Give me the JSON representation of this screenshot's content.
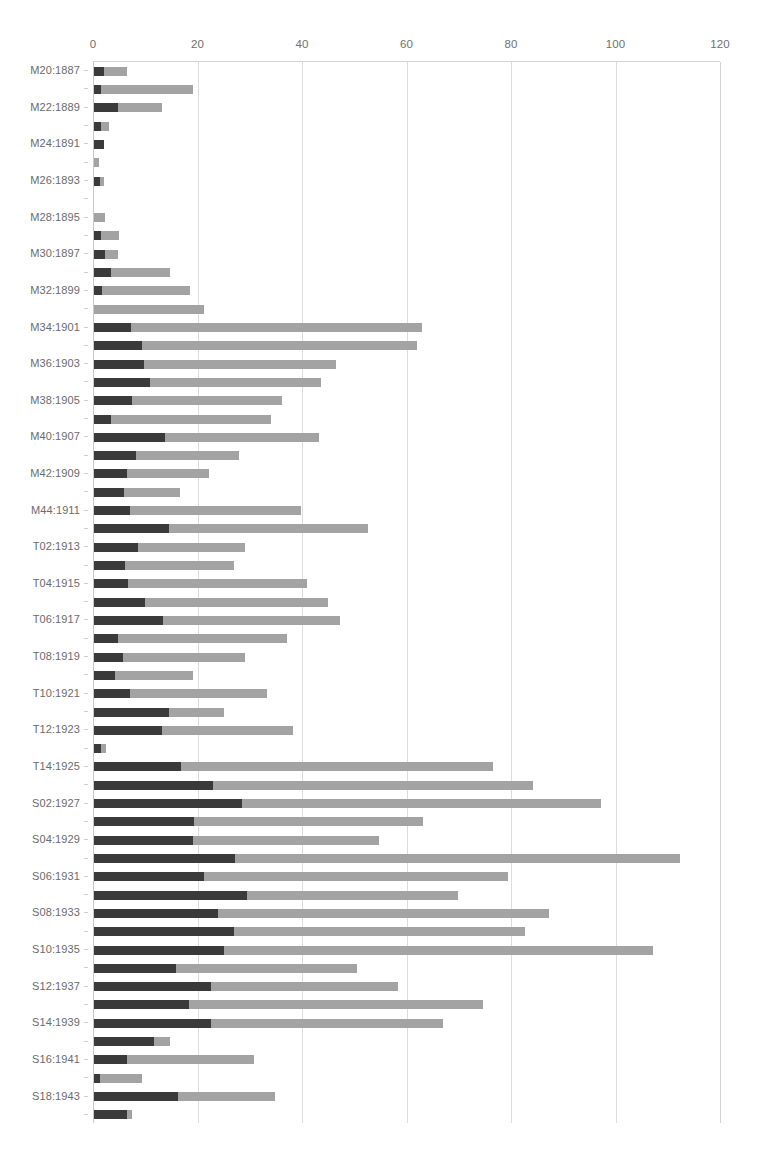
{
  "chart_data": {
    "type": "bar",
    "orientation": "horizontal",
    "stacked": true,
    "title": "",
    "subtitle": "",
    "xlabel": "",
    "ylabel": "",
    "xlim": [
      0,
      120
    ],
    "xticks": [
      0,
      20,
      40,
      60,
      80,
      100,
      120
    ],
    "xtick_labels": [
      "0",
      "20",
      "40",
      "60",
      "80",
      "100",
      "120"
    ],
    "grid": "vertical",
    "legend_position": "none",
    "series": [
      {
        "name": "dark-segment",
        "color": "#3a3a3a"
      },
      {
        "name": "light-segment",
        "color": "#a3a3a3"
      }
    ],
    "categories": [
      "M20:1887",
      "M21:1888",
      "M22:1889",
      "M23:1890",
      "M24:1891",
      "M25:1892",
      "M26:1893",
      "M27:1894",
      "M28:1895",
      "M29:1896",
      "M30:1897",
      "M31:1898",
      "M32:1899",
      "M33:1900",
      "M34:1901",
      "M35:1902",
      "M36:1903",
      "M37:1904",
      "M38:1905",
      "M39:1906",
      "M40:1907",
      "M41:1908",
      "M42:1909",
      "M43:1910",
      "M44:1911",
      "M45:1912",
      "T02:1913",
      "T03:1914",
      "T04:1915",
      "T05:1916",
      "T06:1917",
      "T07:1918",
      "T08:1919",
      "T09:1920",
      "T10:1921",
      "T11:1922",
      "T12:1923",
      "T13:1924",
      "T14:1925",
      "T15:1926",
      "S02:1927",
      "S03:1928",
      "S04:1929",
      "S05:1930",
      "S06:1931",
      "S07:1932",
      "S08:1933",
      "S09:1934",
      "S10:1935",
      "S11:1936",
      "S12:1937",
      "S13:1938",
      "S14:1939",
      "S15:1940",
      "S16:1941",
      "S17:1942",
      "S18:1943",
      "S19:1944"
    ],
    "visible_tick_labels": [
      "M20:1887",
      "M22:1889",
      "M24:1891",
      "M26:1893",
      "M28:1895",
      "M30:1897",
      "M32:1899",
      "M34:1901",
      "M36:1903",
      "M38:1905",
      "M40:1907",
      "M42:1909",
      "M44:1911",
      "T02:1913",
      "T04:1915",
      "T06:1917",
      "T08:1919",
      "T10:1921",
      "T12:1923",
      "T14:1925",
      "S02:1927",
      "S04:1929",
      "S06:1931",
      "S08:1933",
      "S10:1935",
      "S12:1937",
      "S14:1939",
      "S16:1941",
      "S18:1943"
    ],
    "rows": [
      {
        "category": "M20:1887",
        "dark": 2.0,
        "light": 4.3,
        "total": 6.3
      },
      {
        "category": "M21:1888",
        "dark": 1.4,
        "light": 17.6,
        "total": 19.0
      },
      {
        "category": "M22:1889",
        "dark": 4.6,
        "light": 8.4,
        "total": 13.0
      },
      {
        "category": "M23:1890",
        "dark": 1.4,
        "light": 1.5,
        "total": 2.9
      },
      {
        "category": "M24:1891",
        "dark": 2.0,
        "light": 0.0,
        "total": 2.0
      },
      {
        "category": "M25:1892",
        "dark": 0.0,
        "light": 0.9,
        "total": 0.9
      },
      {
        "category": "M26:1893",
        "dark": 1.2,
        "light": 0.7,
        "total": 1.9
      },
      {
        "category": "M27:1894",
        "dark": 0.0,
        "light": 0.0,
        "total": 0.0
      },
      {
        "category": "M28:1895",
        "dark": 0.0,
        "light": 2.2,
        "total": 2.2
      },
      {
        "category": "M29:1896",
        "dark": 1.4,
        "light": 3.3,
        "total": 4.7
      },
      {
        "category": "M30:1897",
        "dark": 2.2,
        "light": 2.4,
        "total": 4.6
      },
      {
        "category": "M31:1898",
        "dark": 3.3,
        "light": 11.2,
        "total": 14.5
      },
      {
        "category": "M32:1899",
        "dark": 1.5,
        "light": 16.9,
        "total": 18.4
      },
      {
        "category": "M33:1900",
        "dark": 0.0,
        "light": 21.0,
        "total": 21.0
      },
      {
        "category": "M34:1901",
        "dark": 7.1,
        "light": 55.7,
        "total": 62.8
      },
      {
        "category": "M35:1902",
        "dark": 9.2,
        "light": 52.6,
        "total": 61.8
      },
      {
        "category": "M36:1903",
        "dark": 9.6,
        "light": 36.7,
        "total": 46.3
      },
      {
        "category": "M37:1904",
        "dark": 10.7,
        "light": 32.7,
        "total": 43.4
      },
      {
        "category": "M38:1905",
        "dark": 7.3,
        "light": 28.7,
        "total": 36.0
      },
      {
        "category": "M39:1906",
        "dark": 3.2,
        "light": 30.7,
        "total": 33.9
      },
      {
        "category": "M40:1907",
        "dark": 13.6,
        "light": 29.4,
        "total": 43.0
      },
      {
        "category": "M41:1908",
        "dark": 8.0,
        "light": 19.8,
        "total": 27.8
      },
      {
        "category": "M42:1909",
        "dark": 6.4,
        "light": 15.6,
        "total": 22.0
      },
      {
        "category": "M43:1910",
        "dark": 5.8,
        "light": 10.7,
        "total": 16.5
      },
      {
        "category": "M44:1911",
        "dark": 6.9,
        "light": 32.7,
        "total": 39.6
      },
      {
        "category": "M45:1912",
        "dark": 14.3,
        "light": 38.1,
        "total": 52.4
      },
      {
        "category": "T02:1913",
        "dark": 8.5,
        "light": 20.4,
        "total": 28.9
      },
      {
        "category": "T03:1914",
        "dark": 6.0,
        "light": 20.8,
        "total": 26.8
      },
      {
        "category": "T04:1915",
        "dark": 6.6,
        "light": 34.2,
        "total": 40.8
      },
      {
        "category": "T05:1916",
        "dark": 9.8,
        "light": 35.0,
        "total": 44.8
      },
      {
        "category": "T06:1917",
        "dark": 13.2,
        "light": 33.8,
        "total": 47.0
      },
      {
        "category": "T07:1918",
        "dark": 4.6,
        "light": 32.4,
        "total": 37.0
      },
      {
        "category": "T08:1919",
        "dark": 5.6,
        "light": 23.3,
        "total": 28.9
      },
      {
        "category": "T09:1920",
        "dark": 4.0,
        "light": 14.9,
        "total": 18.9
      },
      {
        "category": "T10:1921",
        "dark": 6.8,
        "light": 26.3,
        "total": 33.1
      },
      {
        "category": "T11:1922",
        "dark": 14.4,
        "light": 10.4,
        "total": 24.8
      },
      {
        "category": "T12:1923",
        "dark": 13.0,
        "light": 25.0,
        "total": 38.0
      },
      {
        "category": "T13:1924",
        "dark": 1.4,
        "light": 0.9,
        "total": 2.3
      },
      {
        "category": "T14:1925",
        "dark": 16.7,
        "light": 59.6,
        "total": 76.3
      },
      {
        "category": "T15:1926",
        "dark": 22.7,
        "light": 61.4,
        "total": 84.1
      },
      {
        "category": "S02:1927",
        "dark": 28.3,
        "light": 68.7,
        "total": 97.0
      },
      {
        "category": "S03:1928",
        "dark": 19.2,
        "light": 43.8,
        "total": 63.0
      },
      {
        "category": "S04:1929",
        "dark": 19.0,
        "light": 35.6,
        "total": 54.6
      },
      {
        "category": "S05:1930",
        "dark": 27.0,
        "light": 85.2,
        "total": 112.2
      },
      {
        "category": "S06:1931",
        "dark": 21.0,
        "light": 58.2,
        "total": 79.2
      },
      {
        "category": "S07:1932",
        "dark": 29.3,
        "light": 40.4,
        "total": 69.7
      },
      {
        "category": "S08:1933",
        "dark": 23.8,
        "light": 63.2,
        "total": 87.0
      },
      {
        "category": "S09:1934",
        "dark": 26.8,
        "light": 55.7,
        "total": 82.5
      },
      {
        "category": "S10:1935",
        "dark": 24.8,
        "light": 82.2,
        "total": 107.0
      },
      {
        "category": "S11:1936",
        "dark": 15.6,
        "light": 34.8,
        "total": 50.4
      },
      {
        "category": "S12:1937",
        "dark": 22.4,
        "light": 35.8,
        "total": 58.2
      },
      {
        "category": "S13:1938",
        "dark": 18.2,
        "light": 56.3,
        "total": 74.5
      },
      {
        "category": "S14:1939",
        "dark": 22.3,
        "light": 44.5,
        "total": 66.8
      },
      {
        "category": "S15:1940",
        "dark": 11.4,
        "light": 3.2,
        "total": 14.6
      },
      {
        "category": "S16:1941",
        "dark": 6.3,
        "light": 24.3,
        "total": 30.6
      },
      {
        "category": "S17:1942",
        "dark": 1.2,
        "light": 8.0,
        "total": 9.2
      },
      {
        "category": "S18:1943",
        "dark": 16.0,
        "light": 18.6,
        "total": 34.6
      },
      {
        "category": "S19:1944",
        "dark": 6.4,
        "light": 0.8,
        "total": 7.2
      }
    ]
  },
  "caption": {
    "text": ""
  }
}
